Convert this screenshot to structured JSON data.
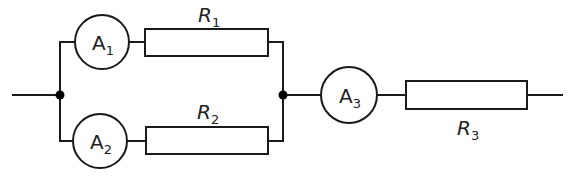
{
  "diagram": {
    "type": "circuit",
    "colors": {
      "line": "#1a1a1a",
      "background": "#ffffff",
      "node": "#000000"
    },
    "ammeters": [
      {
        "id": "A1",
        "letter": "A",
        "sub": "1",
        "branch": "top"
      },
      {
        "id": "A2",
        "letter": "A",
        "sub": "2",
        "branch": "bottom"
      },
      {
        "id": "A3",
        "letter": "A",
        "sub": "3",
        "branch": "main"
      }
    ],
    "resistors": [
      {
        "id": "R1",
        "letter": "R",
        "sub": "1",
        "branch": "top"
      },
      {
        "id": "R2",
        "letter": "R",
        "sub": "2",
        "branch": "bottom"
      },
      {
        "id": "R3",
        "letter": "R",
        "sub": "3",
        "branch": "main"
      }
    ],
    "junctions": [
      "left-junction",
      "right-junction"
    ]
  }
}
